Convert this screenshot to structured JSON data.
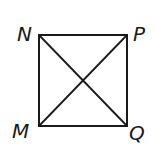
{
  "diagram": {
    "type": "geometry",
    "shape": "square-with-diagonals",
    "stroke_color": "#1a1a1a",
    "background": "#ffffff",
    "vertices": {
      "N": {
        "label": "N",
        "x": 39,
        "y": 35,
        "position": "top-left"
      },
      "P": {
        "label": "P",
        "x": 127,
        "y": 35,
        "position": "top-right"
      },
      "M": {
        "label": "M",
        "x": 39,
        "y": 126,
        "position": "bottom-left"
      },
      "Q": {
        "label": "Q",
        "x": 127,
        "y": 126,
        "position": "bottom-right"
      }
    },
    "edges": [
      {
        "from": "N",
        "to": "P"
      },
      {
        "from": "P",
        "to": "Q"
      },
      {
        "from": "Q",
        "to": "M"
      },
      {
        "from": "M",
        "to": "N"
      }
    ],
    "diagonals": [
      {
        "from": "N",
        "to": "Q"
      },
      {
        "from": "M",
        "to": "P"
      }
    ]
  }
}
